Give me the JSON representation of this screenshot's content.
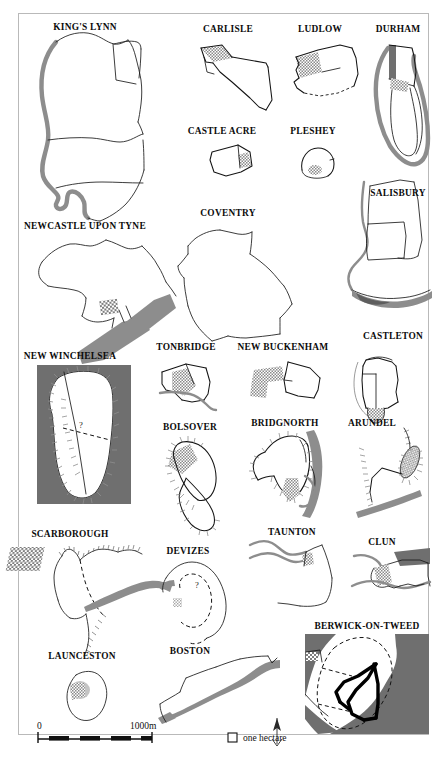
{
  "figure": {
    "title": "",
    "type": "medieval-town-plans-map-plate",
    "towns": [
      {
        "id": "kings-lynn",
        "label": "KING'S LYNN",
        "label_x": 85,
        "label_y": 28
      },
      {
        "id": "carlisle",
        "label": "CARLISLE",
        "label_x": 228,
        "label_y": 30
      },
      {
        "id": "ludlow",
        "label": "LUDLOW",
        "label_x": 320,
        "label_y": 30
      },
      {
        "id": "durham",
        "label": "DURHAM",
        "label_x": 398,
        "label_y": 30
      },
      {
        "id": "castle-acre",
        "label": "CASTLE ACRE",
        "label_x": 222,
        "label_y": 132
      },
      {
        "id": "pleshey",
        "label": "PLESHEY",
        "label_x": 313,
        "label_y": 132
      },
      {
        "id": "salisbury",
        "label": "SALISBURY",
        "label_x": 398,
        "label_y": 194
      },
      {
        "id": "newcastle",
        "label": "NEWCASTLE UPON TYNE",
        "label_x": 85,
        "label_y": 227
      },
      {
        "id": "coventry",
        "label": "COVENTRY",
        "label_x": 228,
        "label_y": 214
      },
      {
        "id": "new-winchelsea",
        "label": "NEW WINCHELSEA",
        "label_x": 70,
        "label_y": 357
      },
      {
        "id": "tonbridge",
        "label": "TONBRIDGE",
        "label_x": 186,
        "label_y": 348
      },
      {
        "id": "new-buckenham",
        "label": "NEW BUCKENHAM",
        "label_x": 283,
        "label_y": 348
      },
      {
        "id": "castleton",
        "label": "CASTLETON",
        "label_x": 393,
        "label_y": 337
      },
      {
        "id": "bolsover",
        "label": "BOLSOVER",
        "label_x": 190,
        "label_y": 428
      },
      {
        "id": "bridgnorth",
        "label": "BRIDGNORTH",
        "label_x": 285,
        "label_y": 424
      },
      {
        "id": "arundel",
        "label": "ARUNDEL",
        "label_x": 372,
        "label_y": 424
      },
      {
        "id": "scarborough",
        "label": "SCARBOROUGH",
        "label_x": 70,
        "label_y": 535
      },
      {
        "id": "devizes",
        "label": "DEVIZES",
        "label_x": 188,
        "label_y": 552
      },
      {
        "id": "taunton",
        "label": "TAUNTON",
        "label_x": 292,
        "label_y": 533
      },
      {
        "id": "clun",
        "label": "CLUN",
        "label_x": 382,
        "label_y": 543
      },
      {
        "id": "berwick-on-tweed",
        "label": "BERWICK-ON-TWEED",
        "label_x": 367,
        "label_y": 627
      },
      {
        "id": "launceston",
        "label": "LAUNCESTON",
        "label_x": 82,
        "label_y": 657
      },
      {
        "id": "boston",
        "label": "BOSTON",
        "label_x": 190,
        "label_y": 652
      }
    ],
    "annotations": [
      {
        "id": "new-winchelsea-query",
        "text": "?",
        "x": 81,
        "y": 428
      },
      {
        "id": "devizes-query",
        "text": "?",
        "x": 197,
        "y": 588
      }
    ],
    "scale_bar": {
      "zero_label": "0",
      "max_label": "1000m",
      "zero_x": 40,
      "max_x": 157,
      "bar_y": 739,
      "bar_left": 38,
      "bar_right": 152,
      "segments": 5
    },
    "legend": {
      "hectare_label": "one hectare",
      "swatch_x": 228,
      "swatch_y": 733,
      "swatch_size": 9,
      "text_x": 243,
      "text_y": 741
    },
    "north_arrow": {
      "label": "N",
      "x": 277,
      "y": 726
    },
    "colors": {
      "wall_line": "#141414",
      "water": "#8d8d8d",
      "sea": "#6f6f6f",
      "castle_hatch": "#8a8a8a",
      "frame": "#b9b9b9",
      "background": "#ffffff",
      "text": "#0b0b0b"
    }
  }
}
